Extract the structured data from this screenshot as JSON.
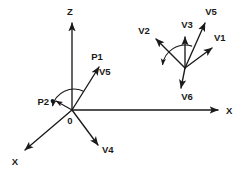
{
  "figure": {
    "background_color": "#ffffff",
    "ink_color": "#1a1a1a",
    "width": 244,
    "height": 176
  },
  "left_system": {
    "name": "left-coordinate-system",
    "origin_label": "0",
    "axes": [
      {
        "id": "axis-z",
        "label": "Z",
        "label_x": 70,
        "label_y": 12,
        "from": [
          72,
          110
        ],
        "to": [
          72,
          23
        ]
      },
      {
        "id": "axis-x-right",
        "label": "X",
        "label_x": 228,
        "label_y": 111,
        "from": [
          72,
          110
        ],
        "to": [
          218,
          110
        ]
      },
      {
        "id": "axis-x-front",
        "label": "X",
        "label_x": 15,
        "label_y": 162,
        "from": [
          72,
          110
        ],
        "to": [
          24,
          151
        ]
      }
    ],
    "origin": {
      "x": 72,
      "y": 110,
      "label_x": 70,
      "label_y": 120
    },
    "vectors": [
      {
        "id": "vector-p1-v5",
        "head_label": "P1",
        "head_label_x": 97,
        "head_label_y": 57,
        "side_label": "V5",
        "side_label_x": 103,
        "side_label_y": 72,
        "from": [
          72,
          110
        ],
        "to": [
          99,
          66
        ]
      },
      {
        "id": "vector-p2",
        "head_label": "P2",
        "head_label_x": 38,
        "head_label_y": 102,
        "from": [
          72,
          110
        ],
        "to": [
          55,
          101
        ]
      },
      {
        "id": "vector-v4",
        "head_label": "V4",
        "head_label_x": 105,
        "head_label_y": 150,
        "from": [
          72,
          110
        ],
        "to": [
          98,
          144
        ]
      }
    ],
    "point_marker": {
      "id": "p2-point-dot",
      "x": 52,
      "y": 101
    },
    "angle_arc": {
      "id": "left-angle-arc",
      "cx": 72,
      "cy": 110,
      "r": 22,
      "start_deg": 58,
      "end_deg": 152
    }
  },
  "right_system": {
    "name": "right-vector-fan",
    "vertex": {
      "x": 185,
      "y": 68
    },
    "vectors": [
      {
        "id": "vector-v1",
        "label": "V1",
        "label_x": 219,
        "label_y": 38,
        "from": [
          185,
          68
        ],
        "to": [
          213,
          47
        ]
      },
      {
        "id": "vector-v2",
        "label": "V2",
        "label_x": 143,
        "label_y": 31,
        "from": [
          185,
          68
        ],
        "to": [
          155,
          38
        ]
      },
      {
        "id": "vector-v3",
        "label": "V3",
        "label_x": 187,
        "label_y": 25,
        "from": [
          185,
          68
        ],
        "to": [
          185,
          36
        ]
      },
      {
        "id": "vector-v5",
        "label": "V5",
        "label_x": 210,
        "label_y": 12,
        "from": [
          185,
          68
        ],
        "to": [
          205,
          22
        ]
      },
      {
        "id": "vector-v6",
        "label": "V6",
        "label_x": 187,
        "label_y": 97,
        "from": [
          185,
          68
        ],
        "to": [
          181,
          89
        ]
      }
    ],
    "angle_arc": {
      "id": "right-angle-arc",
      "cx": 185,
      "cy": 68,
      "r": 23,
      "start_deg": 72,
      "end_deg": 182
    }
  }
}
